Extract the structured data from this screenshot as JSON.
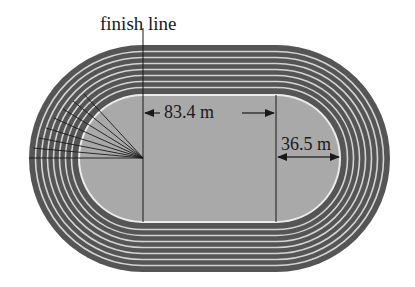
{
  "diagram": {
    "labels": {
      "finish_line": "finish line",
      "straight_length": "83.4 m",
      "radius": "36.5 m"
    },
    "track": {
      "lanes": 8,
      "infield_color": "#a9a9a9",
      "lane_color": "#555555",
      "lane_line_color": "#d8d8d8"
    },
    "measurements": [
      {
        "name": "straight length",
        "value": "83.4 m"
      },
      {
        "name": "inner radius",
        "value": "36.5 m"
      }
    ]
  }
}
